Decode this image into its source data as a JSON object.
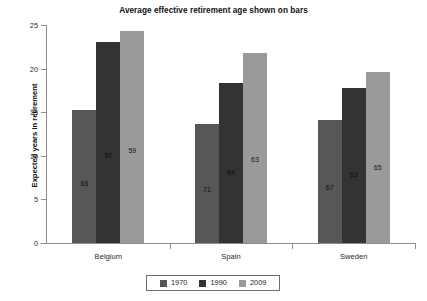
{
  "chart_data": {
    "type": "bar",
    "title": "Average effective retirement age shown on bars",
    "xlabel": "",
    "ylabel": "Expected years in retirement",
    "ylim": [
      0,
      25
    ],
    "yticks": [
      0,
      5,
      10,
      15,
      20,
      25
    ],
    "ytick_labels": [
      "0",
      "5",
      "10",
      "15",
      "20",
      "25"
    ],
    "grid": false,
    "legend_position": "bottom-center",
    "categories": [
      "Belgium",
      "Spain",
      "Sweden"
    ],
    "series": [
      {
        "name": "1970",
        "color": "#575757",
        "values": [
          15.2,
          13.7,
          14.1
        ],
        "bar_labels": [
          "63",
          "71",
          "67"
        ]
      },
      {
        "name": "1990",
        "color": "#333333",
        "values": [
          23.0,
          18.3,
          17.8
        ],
        "bar_labels": [
          "57",
          "64",
          "63"
        ]
      },
      {
        "name": "2009",
        "color": "#9a9a9a",
        "values": [
          24.3,
          21.8,
          19.6
        ],
        "bar_labels": [
          "59",
          "63",
          "65"
        ]
      }
    ],
    "bar_label_meaning": "Average effective retirement age (years)",
    "axis_color": "#8d8d8d",
    "background_color": "#ffffff"
  }
}
